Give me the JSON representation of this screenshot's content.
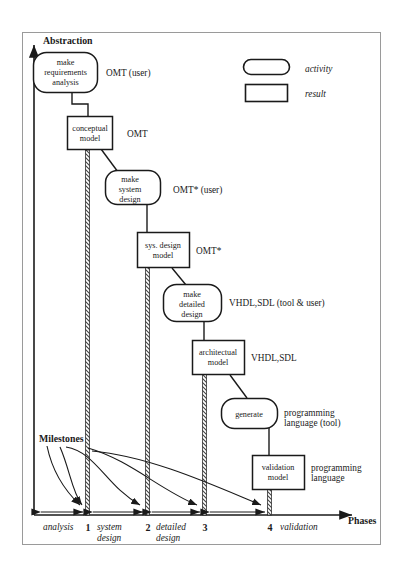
{
  "diagram": {
    "title_axis_y": "Abstraction",
    "title_axis_x": "Phases",
    "milestones_label": "Milestones",
    "legend": [
      {
        "shape": "rounded-pill",
        "label": "activity"
      },
      {
        "shape": "rectangle",
        "label": "result"
      }
    ],
    "activities": [
      {
        "id": "make-requirements-analysis",
        "lines": [
          "make",
          "requirements",
          "analysis"
        ],
        "annotation": "OMT (user)"
      },
      {
        "id": "make-system-design",
        "lines": [
          "make",
          "system",
          "design"
        ],
        "annotation": "OMT* (user)"
      },
      {
        "id": "make-detailed-design",
        "lines": [
          "make",
          "detailed",
          "design"
        ],
        "annotation": "VHDL,SDL (tool & user)"
      },
      {
        "id": "generate",
        "lines": [
          "generate"
        ],
        "annotation": "programming language (tool)"
      }
    ],
    "results": [
      {
        "id": "conceptual-model",
        "lines": [
          "conceptual",
          "model"
        ],
        "annotation": "OMT"
      },
      {
        "id": "sys-design-model",
        "lines": [
          "sys. design",
          "model"
        ],
        "annotation": "OMT*"
      },
      {
        "id": "architectual-model",
        "lines": [
          "architectual",
          "model"
        ],
        "annotation": "VHDL,SDL"
      },
      {
        "id": "validation-model",
        "lines": [
          "validation",
          "model"
        ],
        "annotation": "programming language"
      }
    ],
    "annotations": [
      {
        "id": "ann-omt-user",
        "text": "OMT (user)"
      },
      {
        "id": "ann-omt",
        "text": "OMT"
      },
      {
        "id": "ann-omt-star-user",
        "text": "OMT* (user)"
      },
      {
        "id": "ann-omt-star",
        "text": "OMT*"
      },
      {
        "id": "ann-vhdl-sdl-tool-user",
        "text": "VHDL,SDL (tool & user)"
      },
      {
        "id": "ann-vhdl-sdl",
        "text": "VHDL,SDL"
      },
      {
        "id": "ann-prog-lang-tool-1",
        "text": "programming"
      },
      {
        "id": "ann-prog-lang-tool-2",
        "text": "language (tool)"
      },
      {
        "id": "ann-prog-lang-1",
        "text": "programming"
      },
      {
        "id": "ann-prog-lang-2",
        "text": "language"
      }
    ],
    "phases": [
      {
        "id": "phase-analysis",
        "lines": [
          "analysis"
        ]
      },
      {
        "id": "phase-system-design",
        "lines": [
          "system",
          "design"
        ]
      },
      {
        "id": "phase-detailed-design",
        "lines": [
          "detailed",
          "design"
        ]
      },
      {
        "id": "phase-validation",
        "lines": [
          "validation"
        ]
      }
    ],
    "milestone_numbers": [
      "1",
      "2",
      "3",
      "4"
    ],
    "colors": {
      "stroke": "#1a1a1a",
      "background": "#ffffff",
      "frame": "#999999",
      "hatch": "#555555"
    }
  }
}
